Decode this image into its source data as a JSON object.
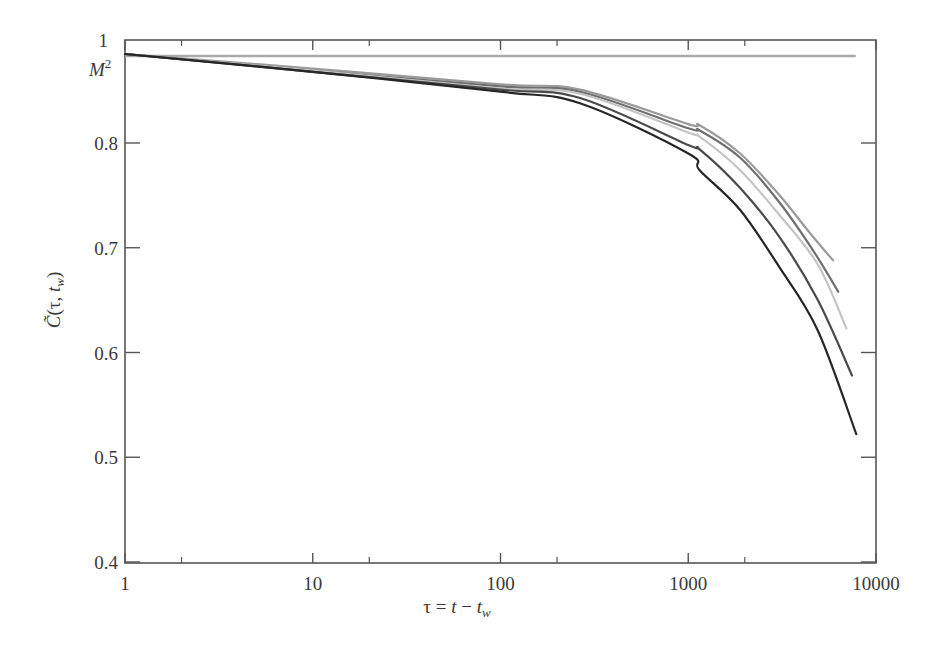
{
  "chart_data": {
    "type": "line",
    "title": "",
    "xlabel": "τ = t − t_w",
    "ylabel": "C̃(τ, t_w)",
    "xscale": "log",
    "xlim": [
      1,
      10000
    ],
    "ylim": [
      0.4,
      0.898
    ],
    "x_ticks": [
      1,
      10,
      100,
      1000,
      10000
    ],
    "x_tick_labels": [
      "1",
      "10",
      "100",
      "1000",
      "10000"
    ],
    "x_minor_ticks": [
      2,
      20,
      200,
      2000
    ],
    "y_ticks": [
      0.4,
      0.5,
      0.6,
      0.7,
      0.8
    ],
    "y_tick_labels": [
      "0.4",
      "0.5",
      "0.6",
      "0.7",
      "0.8"
    ],
    "y_top_label": "1",
    "grid": false,
    "legend": null,
    "annotations": [
      {
        "text": "M",
        "superscript": "2",
        "y": 0.883,
        "note": "horizontal reference line labeled M²"
      }
    ],
    "reference_line": {
      "name": "M²",
      "y": 0.883,
      "x_range": [
        1,
        7800
      ],
      "color": "#aaaaaa"
    },
    "x": [
      1,
      10,
      100,
      265,
      1000,
      1150,
      1890,
      3070
    ],
    "series": [
      {
        "name": "curve-1",
        "color": "#9a9a9a",
        "points": [
          [
            1,
            0.885
          ],
          [
            10,
            0.871
          ],
          [
            100,
            0.856
          ],
          [
            265,
            0.851
          ],
          [
            1000,
            0.818
          ],
          [
            1150,
            0.817
          ],
          [
            1890,
            0.79
          ],
          [
            3070,
            0.75
          ],
          [
            4400,
            0.715
          ],
          [
            5900,
            0.688
          ]
        ]
      },
      {
        "name": "curve-2",
        "color": "#6f6f6f",
        "points": [
          [
            1,
            0.885
          ],
          [
            10,
            0.869
          ],
          [
            100,
            0.854
          ],
          [
            265,
            0.849
          ],
          [
            1000,
            0.814
          ],
          [
            1150,
            0.812
          ],
          [
            1890,
            0.786
          ],
          [
            3070,
            0.743
          ],
          [
            4600,
            0.698
          ],
          [
            6300,
            0.658
          ]
        ]
      },
      {
        "name": "curve-3",
        "color": "#c4c4c4",
        "points": [
          [
            1,
            0.885
          ],
          [
            10,
            0.869
          ],
          [
            100,
            0.852
          ],
          [
            265,
            0.847
          ],
          [
            1000,
            0.81
          ],
          [
            1150,
            0.806
          ],
          [
            1890,
            0.774
          ],
          [
            3070,
            0.731
          ],
          [
            4900,
            0.684
          ],
          [
            6960,
            0.623
          ]
        ]
      },
      {
        "name": "curve-4",
        "color": "#4a4a4a",
        "points": [
          [
            1,
            0.885
          ],
          [
            10,
            0.868
          ],
          [
            100,
            0.851
          ],
          [
            265,
            0.843
          ],
          [
            1000,
            0.798
          ],
          [
            1150,
            0.794
          ],
          [
            1890,
            0.757
          ],
          [
            3070,
            0.71
          ],
          [
            4900,
            0.65
          ],
          [
            7450,
            0.578
          ]
        ]
      },
      {
        "name": "curve-5",
        "color": "#262626",
        "points": [
          [
            1,
            0.885
          ],
          [
            10,
            0.868
          ],
          [
            100,
            0.849
          ],
          [
            265,
            0.838
          ],
          [
            1000,
            0.79
          ],
          [
            1150,
            0.774
          ],
          [
            1890,
            0.736
          ],
          [
            3070,
            0.681
          ],
          [
            4900,
            0.621
          ],
          [
            7850,
            0.522
          ]
        ]
      }
    ]
  },
  "layout": {
    "plot_left": 125,
    "plot_right": 876,
    "plot_top": 40,
    "plot_bottom": 563,
    "axis_color": "#555555"
  }
}
